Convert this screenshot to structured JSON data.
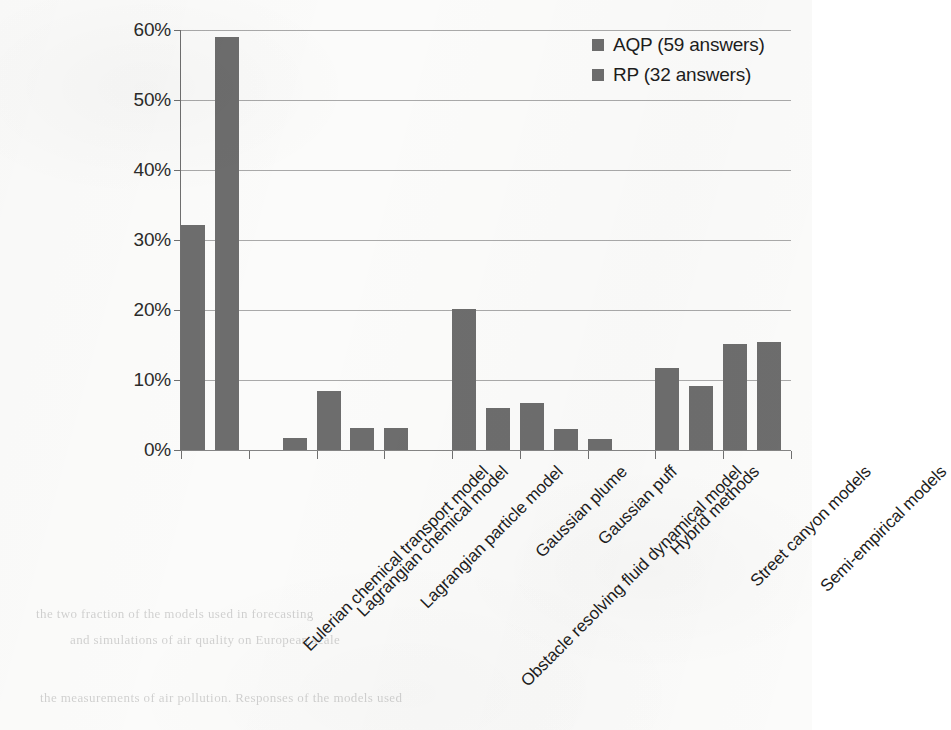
{
  "chart_data": {
    "type": "bar",
    "title": "",
    "xlabel": "",
    "ylabel": "",
    "ylim": [
      0,
      60
    ],
    "ytick_labels": [
      "60%",
      "50%",
      "40%",
      "30%",
      "20%",
      "10%",
      "0%"
    ],
    "ytick_values": [
      60,
      50,
      40,
      30,
      20,
      10,
      0
    ],
    "grid": true,
    "legend_position": "top-right",
    "categories": [
      "Eulerian chemical transport model",
      "Lagrangian chemical model",
      "Lagrangian particle model",
      "Obstacle resolving fluid dynamical model",
      "Gaussian plume",
      "Gaussian puff",
      "Hybrid methods",
      "Street canyon models",
      "Semi-empirical models"
    ],
    "series": [
      {
        "name": "AQP (59 answers)",
        "color": "#6d6d6d",
        "values": [
          32.2,
          0,
          8.5,
          3.1,
          20.2,
          6.7,
          1.6,
          11.7,
          15.1
        ]
      },
      {
        "name": "RP (32 answers)",
        "color": "#6d6d6d",
        "values": [
          59.0,
          1.7,
          3.2,
          0,
          6.0,
          3.0,
          0,
          9.2,
          15.4
        ]
      }
    ]
  },
  "legend": {
    "entries": [
      {
        "label": "AQP (59 answers)"
      },
      {
        "label": "RP (32 answers)"
      }
    ]
  },
  "scan_artifacts": {
    "ghost_1": "the two fraction of the models used in forecasting",
    "ghost_2": "and simulations of air quality on European scale",
    "ghost_3": "the measurements of air pollution. Responses of the models used"
  }
}
